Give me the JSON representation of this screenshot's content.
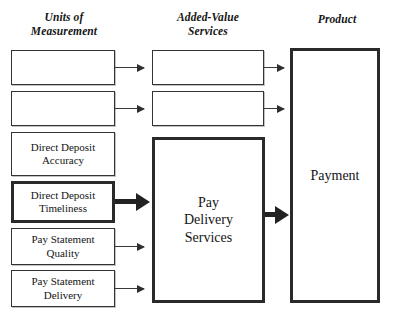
{
  "diagram": {
    "columns": [
      {
        "id": "units",
        "heading": "Units of\nMeasurement"
      },
      {
        "id": "services",
        "heading": "Added-Value\nServices"
      },
      {
        "id": "product",
        "heading": "Product"
      }
    ],
    "units_boxes": [
      {
        "id": "u1",
        "label": "",
        "emphasis": "normal"
      },
      {
        "id": "u2",
        "label": "",
        "emphasis": "normal"
      },
      {
        "id": "u3",
        "label": "Direct Deposit\nAccuracy",
        "emphasis": "normal"
      },
      {
        "id": "u4",
        "label": "Direct Deposit\nTimeliness",
        "emphasis": "bold"
      },
      {
        "id": "u5",
        "label": "Pay Statement\nQuality",
        "emphasis": "normal"
      },
      {
        "id": "u6",
        "label": "Pay Statement\nDelivery",
        "emphasis": "normal"
      }
    ],
    "services_boxes": [
      {
        "id": "s1",
        "label": "",
        "emphasis": "normal"
      },
      {
        "id": "s2",
        "label": "",
        "emphasis": "normal"
      },
      {
        "id": "s3",
        "label": "Pay\nDelivery\nServices",
        "emphasis": "bold"
      }
    ],
    "product_boxes": [
      {
        "id": "p1",
        "label": "Payment",
        "emphasis": "bold"
      }
    ],
    "connectors": [
      {
        "id": "lnk-u1",
        "from": "u1",
        "to": "s1",
        "style": "thin",
        "icon": "arrow-right-icon"
      },
      {
        "id": "lnk-u2",
        "from": "u2",
        "to": "s2",
        "style": "thin",
        "icon": "arrow-right-icon"
      },
      {
        "id": "lnk-u4",
        "from": "u4",
        "to": "s3",
        "style": "bold",
        "icon": "arrow-right-bold-icon"
      },
      {
        "id": "lnk-u5",
        "from": "u5",
        "to": "s3",
        "style": "thin",
        "icon": "arrow-right-icon"
      },
      {
        "id": "lnk-u6",
        "from": "u6",
        "to": "s3",
        "style": "thin",
        "icon": "arrow-right-icon"
      },
      {
        "id": "lnk-s1",
        "from": "s1",
        "to": "p1",
        "style": "thin",
        "icon": "arrow-right-icon"
      },
      {
        "id": "lnk-s2",
        "from": "s2",
        "to": "p1",
        "style": "thin",
        "icon": "arrow-right-icon"
      },
      {
        "id": "lnk-s3",
        "from": "s3",
        "to": "p1",
        "style": "bold",
        "icon": "arrow-right-bold-icon"
      }
    ],
    "colors": {
      "background": "#ffffff",
      "thin_stroke": "#333333",
      "bold_stroke": "#2a2a2a",
      "text": "#141414"
    }
  }
}
